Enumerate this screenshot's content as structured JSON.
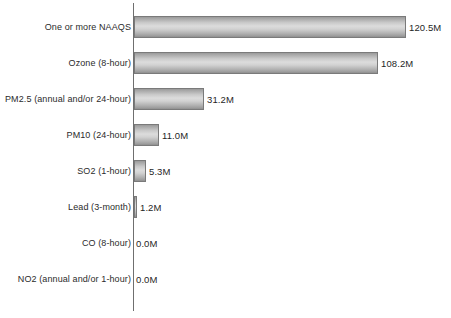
{
  "chart_data": {
    "type": "bar",
    "orientation": "horizontal",
    "title": "",
    "subtitle": "",
    "xlabel": "",
    "ylabel": "",
    "grid": false,
    "legend": null,
    "xlim": [
      0,
      140
    ],
    "value_suffix": "M",
    "categories": [
      "One or more NAAQS",
      "Ozone (8-hour)",
      "PM2.5 (annual and/or 24-hour)",
      "PM10 (24-hour)",
      "SO2 (1-hour)",
      "Lead (3-month)",
      "CO (8-hour)",
      "NO2 (annual and/or 1-hour)"
    ],
    "values": [
      120.5,
      108.2,
      31.2,
      11.0,
      5.3,
      1.2,
      0.0,
      0.0
    ],
    "value_labels": [
      "120.5M",
      "108.2M",
      "31.2M",
      "11.0M",
      "5.3M",
      "1.2M",
      "0.0M",
      "0.0M"
    ],
    "colors": {
      "bar_edge": "#7a7a7a",
      "bar_light": "#dcdcdc",
      "bar_dark": "#9a9a9a",
      "axis": "#6f6f6f",
      "text": "#2b2b2b",
      "background": "#ffffff"
    }
  },
  "axis": {
    "name": "category-axis"
  }
}
